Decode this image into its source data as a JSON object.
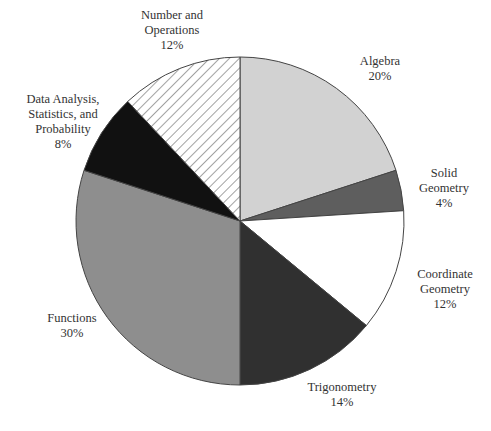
{
  "chart_data": {
    "type": "pie",
    "title": "",
    "start_angle_deg": 0,
    "direction": "clockwise",
    "slices": [
      {
        "label": "Algebra",
        "label_lines": [
          "Algebra"
        ],
        "value": 20,
        "value_label": "20%",
        "fill": "#d2d2d2",
        "pattern": "solid"
      },
      {
        "label": "Solid Geometry",
        "label_lines": [
          "Solid",
          "Geometry"
        ],
        "value": 4,
        "value_label": "4%",
        "fill": "#5e5e5e",
        "pattern": "solid"
      },
      {
        "label": "Coordinate Geometry",
        "label_lines": [
          "Coordinate",
          "Geometry"
        ],
        "value": 12,
        "value_label": "12%",
        "fill": "#ffffff",
        "pattern": "solid"
      },
      {
        "label": "Trigonometry",
        "label_lines": [
          "Trigonometry"
        ],
        "value": 14,
        "value_label": "14%",
        "fill": "#303030",
        "pattern": "solid"
      },
      {
        "label": "Functions",
        "label_lines": [
          "Functions"
        ],
        "value": 30,
        "value_label": "30%",
        "fill": "#8e8e8e",
        "pattern": "solid"
      },
      {
        "label": "Data Analysis, Statistics, and Probability",
        "label_lines": [
          "Data Analysis,",
          "Statistics, and",
          "Probability"
        ],
        "value": 8,
        "value_label": "8%",
        "fill": "#111111",
        "pattern": "solid"
      },
      {
        "label": "Number and Operations",
        "label_lines": [
          "Number and",
          "Operations"
        ],
        "value": 12,
        "value_label": "12%",
        "fill": "#ffffff",
        "pattern": "hatch"
      }
    ]
  },
  "labels": {
    "algebra": {
      "l1": "Algebra",
      "pct": "20%"
    },
    "solid": {
      "l1": "Solid",
      "l2": "Geometry",
      "pct": "4%"
    },
    "coord": {
      "l1": "Coordinate",
      "l2": "Geometry",
      "pct": "12%"
    },
    "trig": {
      "l1": "Trigonometry",
      "pct": "14%"
    },
    "functions": {
      "l1": "Functions",
      "pct": "30%"
    },
    "data": {
      "l1": "Data Analysis,",
      "l2": "Statistics, and",
      "l3": "Probability",
      "pct": "8%"
    },
    "number": {
      "l1": "Number and",
      "l2": "Operations",
      "pct": "12%"
    }
  }
}
